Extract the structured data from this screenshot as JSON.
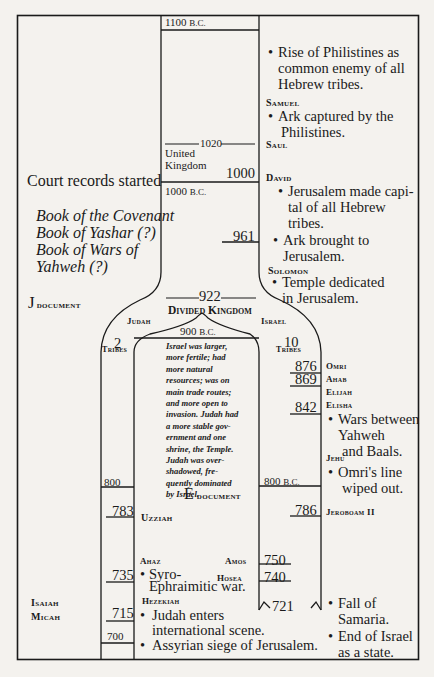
{
  "top": {
    "era_1100": "1100",
    "bc": "B.C.",
    "era_1000": "1000",
    "united_1020": "1020",
    "united_label_1": "United",
    "united_label_2": "Kingdom",
    "year_1000": "1000",
    "year_961": "961",
    "year_922": "922",
    "divided_kingdom": "Divided Kingdom"
  },
  "right_top": {
    "philistines": [
      "Rise of Philistines as",
      "common enemy of all",
      "Hebrew tribes."
    ],
    "samuel": "Samuel",
    "ark_captured": [
      "Ark captured by the",
      "Philistines."
    ],
    "saul": "Saul",
    "david": "David",
    "jerusalem_capital": [
      "Jerusalem made capi-",
      "tal of all Hebrew",
      "tribes."
    ],
    "ark_brought": [
      "Ark brought to",
      "Jerusalem."
    ],
    "solomon": "Solomon",
    "temple": [
      "Temple dedicated",
      "in Jerusalem."
    ]
  },
  "left": {
    "court_records": "Court records started",
    "books": [
      "Book of the Covenant",
      "Book of Yashar (?)",
      "Book of Wars of",
      "Yahweh (?)"
    ],
    "j_document_initial": "J",
    "j_document_rest": "document",
    "isaiah": "Isaiah",
    "micah": "Micah"
  },
  "judah": {
    "label": "Judah",
    "count": "2",
    "tribes": "Tribes",
    "year_800": "800",
    "year_783": "783",
    "uzziah": "Uzziah",
    "year_735": "735",
    "ahaz": "Ahaz",
    "syro": [
      "Syro-",
      "Ephraimitic war."
    ],
    "hezekiah": "Hezekiah",
    "year_715": "715",
    "judah_enters": [
      "Judah enters",
      "international scene."
    ],
    "year_700": "700",
    "assyrian": "Assyrian siege of Jerusalem."
  },
  "middle": {
    "era_900": "900",
    "comparison": [
      "Israel was larger,",
      "more fertile; had",
      "more natural",
      "resources; was on",
      "main trade routes;",
      "and more open to",
      "invasion. Judah had",
      "a more stable gov-",
      "ernment and one",
      "shrine, the Temple.",
      "Judah was over-",
      "shadowed, fre-",
      "quently dominated",
      "by Israel."
    ],
    "e_document_initial": "E",
    "e_document_rest": "document",
    "era_800": "800",
    "amos": "Amos",
    "hosea": "Hosea"
  },
  "israel": {
    "label": "Israel",
    "count": "10",
    "tribes": "Tribes",
    "year_876": "876",
    "omri": "Omri",
    "year_869": "869",
    "ahab": "Ahab",
    "elijah": "Elijah",
    "elisha": "Elisha",
    "year_842": "842",
    "wars": [
      "Wars between",
      "Yahweh",
      "and Baals."
    ],
    "jehu": "Jehu",
    "omri_line": [
      "Omri's line",
      "wiped out."
    ],
    "year_786": "786",
    "jeroboam": "Jeroboam II",
    "year_750": "750",
    "year_740": "740",
    "year_721": "721",
    "fall": [
      "Fall of",
      "Samaria."
    ],
    "end": [
      "End of Israel",
      "as a state."
    ]
  },
  "bullet": "•"
}
